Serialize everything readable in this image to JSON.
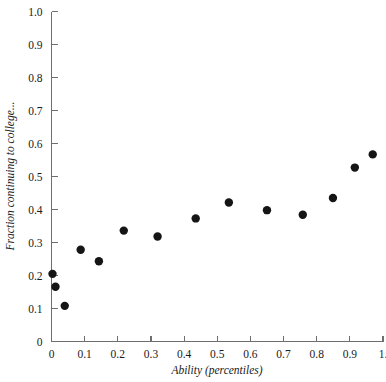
{
  "chart_data": {
    "type": "scatter",
    "title": "",
    "xlabel": "Ability (percentiles)",
    "ylabel": "Fraction continuing to college...",
    "xlim": [
      0,
      1.0
    ],
    "ylim": [
      0,
      1.0
    ],
    "grid": false,
    "legend": false,
    "xticks": [
      "0",
      "0.1",
      "0.2",
      "0.3",
      "0.4",
      "0.5",
      "0.6",
      "0.7",
      "0.8",
      "0.9",
      "1."
    ],
    "xtick_values": [
      0,
      0.1,
      0.2,
      0.3,
      0.4,
      0.5,
      0.6,
      0.7,
      0.8,
      0.9,
      1.0
    ],
    "yticks": [
      "0",
      "0.1",
      "0.2",
      "0.3",
      "0.4",
      "0.5",
      "0.6",
      "0.7",
      "0.8",
      "0.9",
      "1.0"
    ],
    "ytick_values": [
      0,
      0.1,
      0.2,
      0.3,
      0.4,
      0.5,
      0.6,
      0.7,
      0.8,
      0.9,
      1.0
    ],
    "marker": "filled-circle",
    "marker_color": "#151515",
    "marker_size": 4.2,
    "x": [
      0.003,
      0.012,
      0.04,
      0.088,
      0.143,
      0.218,
      0.32,
      0.435,
      0.535,
      0.65,
      0.758,
      0.849,
      0.915,
      0.969
    ],
    "y": [
      0.205,
      0.166,
      0.108,
      0.278,
      0.243,
      0.336,
      0.318,
      0.373,
      0.421,
      0.398,
      0.384,
      0.435,
      0.527,
      0.567
    ],
    "points": [
      {
        "x": 0.003,
        "y": 0.205
      },
      {
        "x": 0.012,
        "y": 0.166
      },
      {
        "x": 0.04,
        "y": 0.108
      },
      {
        "x": 0.088,
        "y": 0.278
      },
      {
        "x": 0.143,
        "y": 0.243
      },
      {
        "x": 0.218,
        "y": 0.336
      },
      {
        "x": 0.32,
        "y": 0.318
      },
      {
        "x": 0.435,
        "y": 0.373
      },
      {
        "x": 0.535,
        "y": 0.421
      },
      {
        "x": 0.65,
        "y": 0.398
      },
      {
        "x": 0.758,
        "y": 0.384
      },
      {
        "x": 0.849,
        "y": 0.435
      },
      {
        "x": 0.915,
        "y": 0.527
      },
      {
        "x": 0.969,
        "y": 0.567
      }
    ]
  },
  "axes": {
    "x_axis_name": "x-axis",
    "y_axis_name": "y-axis"
  }
}
